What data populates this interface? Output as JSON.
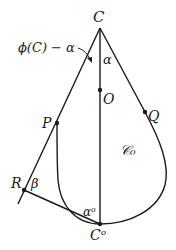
{
  "diagram": {
    "labels": {
      "C": "C",
      "O": "O",
      "P": "P",
      "Q": "Q",
      "R": "R",
      "beta": "β",
      "alpha": "α",
      "alpha_o": "αᵒ",
      "C_o": "Cᵒ",
      "region": "𝒞₀",
      "angle_annotation": "ϕ(C) − α"
    },
    "points": {
      "C": [
        100,
        28
      ],
      "O": [
        100,
        90
      ],
      "P": [
        57,
        123
      ],
      "Q": [
        145,
        112
      ],
      "R": [
        24,
        190
      ],
      "C_o": [
        100,
        224
      ]
    },
    "colors": {
      "stroke": "#1a1a1a",
      "background": "#ffffff"
    }
  }
}
